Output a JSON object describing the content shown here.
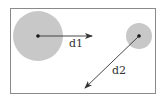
{
  "diagram": {
    "title": "",
    "colors": {
      "background": "#ffffff",
      "frame": "#8a8a8a",
      "circle_fill": "#c8c8c8",
      "center_dot": "#111111",
      "arrow": "#333333",
      "label": "#333333"
    },
    "nodes": [
      {
        "id": "large-circle",
        "label": ""
      },
      {
        "id": "small-circle",
        "label": ""
      }
    ],
    "edges": [
      {
        "id": "d1",
        "from": "large-circle",
        "direction": "right",
        "label": "d1"
      },
      {
        "id": "d2",
        "from": "small-circle",
        "direction": "down-left",
        "label": "d2"
      }
    ]
  }
}
